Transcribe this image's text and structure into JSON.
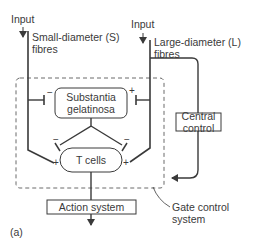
{
  "diagram": {
    "panel_label": "(a)",
    "inputs": {
      "left": {
        "label": "Input",
        "fibre_line1": "Small-diameter (S)",
        "fibre_line2": "fibres"
      },
      "right": {
        "label": "Input",
        "fibre_line1": "Large-diameter (L)",
        "fibre_line2": "fibres"
      }
    },
    "nodes": {
      "substantia_line1": "Substantia",
      "substantia_line2": "gelatinosa",
      "t_cells": "T cells",
      "central_line1": "Central",
      "central_line2": "control",
      "action_system": "Action system"
    },
    "gate_label_line1": "Gate control",
    "gate_label_line2": "system",
    "signs": {
      "sg_left": "−",
      "sg_right": "+",
      "t_left_minus": "−",
      "t_left_plus": "+",
      "t_right_minus": "−",
      "t_right_plus": "+"
    },
    "colors": {
      "line": "#3a3a3a",
      "dashed": "#6a6a6a",
      "background": "#ffffff"
    }
  }
}
